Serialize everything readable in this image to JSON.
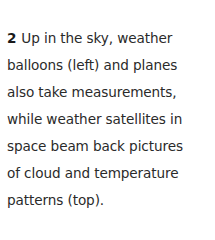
{
  "caption": {
    "number": "2",
    "lines": [
      "Up in the sky, weather",
      "balloons (left) and planes",
      "also take measurements,",
      "while weather satellites in",
      "space beam back pictures",
      "of cloud and temperature",
      "patterns (top)."
    ]
  }
}
